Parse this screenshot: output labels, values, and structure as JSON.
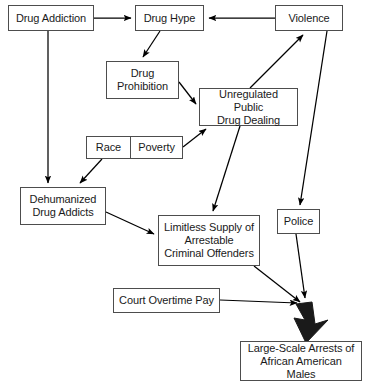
{
  "diagram": {
    "background_color": "#ffffff",
    "box_border_color": "#4d4d4d",
    "text_color": "#1a1a1a",
    "arrow_color": "#000000",
    "nodes": [
      {
        "id": "drug_addiction",
        "label": "Drug Addiction",
        "x": 8,
        "y": 5,
        "w": 86,
        "h": 26
      },
      {
        "id": "drug_hype",
        "label": "Drug Hype",
        "x": 135,
        "y": 5,
        "w": 69,
        "h": 26
      },
      {
        "id": "violence",
        "label": "Violence",
        "x": 275,
        "y": 5,
        "w": 68,
        "h": 26
      },
      {
        "id": "drug_prohibition",
        "label": "Drug\nProhibition",
        "x": 106,
        "y": 61,
        "w": 73,
        "h": 38
      },
      {
        "id": "unregulated_public_drug_dealing",
        "label": "Unregulated Public\nDrug Dealing",
        "x": 199,
        "y": 88,
        "w": 99,
        "h": 38
      },
      {
        "id": "race",
        "label": "Race",
        "x": 86,
        "y": 136,
        "w": 44,
        "h": 23
      },
      {
        "id": "poverty",
        "label": "Poverty",
        "x": 130,
        "y": 136,
        "w": 53,
        "h": 23
      },
      {
        "id": "dehumanized_drug_addicts",
        "label": "Dehumanized\nDrug Addicts",
        "x": 20,
        "y": 187,
        "w": 86,
        "h": 38
      },
      {
        "id": "limitless_supply",
        "label": "Limitless Supply of\nArrestable\nCriminal Offenders",
        "x": 158,
        "y": 215,
        "w": 102,
        "h": 51
      },
      {
        "id": "police",
        "label": "Police",
        "x": 277,
        "y": 209,
        "w": 43,
        "h": 25
      },
      {
        "id": "court_overtime_pay",
        "label": "Court Overtime Pay",
        "x": 113,
        "y": 288,
        "w": 107,
        "h": 25
      },
      {
        "id": "large_scale_arrests",
        "label": "Large-Scale Arrests of\nAfrican American Males",
        "x": 240,
        "y": 341,
        "w": 122,
        "h": 40
      }
    ],
    "edges": [
      {
        "id": "drug-addiction-to-drug-hype",
        "from": "Drug Addiction",
        "to": "Drug Hype",
        "thick": false
      },
      {
        "id": "violence-to-drug-hype",
        "from": "Violence",
        "to": "Drug Hype",
        "thick": false
      },
      {
        "id": "drug-hype-to-drug-prohibition",
        "from": "Drug Hype",
        "to": "Drug Prohibition",
        "thick": false
      },
      {
        "id": "drug-prohibition-to-unregulated-dealing",
        "from": "Drug Prohibition",
        "to": "Unregulated Public Drug Dealing",
        "thick": false
      },
      {
        "id": "unregulated-dealing-to-violence",
        "from": "Unregulated Public Drug Dealing",
        "to": "Violence",
        "thick": false
      },
      {
        "id": "poverty-to-unregulated-dealing",
        "from": "Poverty",
        "to": "Unregulated Public Drug Dealing",
        "thick": false
      },
      {
        "id": "drug-addiction-to-dehumanized-addicts",
        "from": "Drug Addiction",
        "to": "Dehumanized Drug Addicts",
        "thick": false
      },
      {
        "id": "race-to-dehumanized-addicts",
        "from": "Race",
        "to": "Dehumanized Drug Addicts",
        "thick": false
      },
      {
        "id": "dehumanized-addicts-to-limitless-supply",
        "from": "Dehumanized Drug Addicts",
        "to": "Limitless Supply of Arrestable Criminal Offenders",
        "thick": false
      },
      {
        "id": "unregulated-dealing-to-limitless-supply",
        "from": "Unregulated Public Drug Dealing",
        "to": "Limitless Supply of Arrestable Criminal Offenders",
        "thick": false
      },
      {
        "id": "violence-to-police",
        "from": "Violence",
        "to": "Police",
        "thick": false
      },
      {
        "id": "limitless-supply-to-arrests",
        "from": "Limitless Supply of Arrestable Criminal Offenders",
        "to": "Large-Scale Arrests of African American Males",
        "thick": false
      },
      {
        "id": "police-to-arrests",
        "from": "Police",
        "to": "Large-Scale Arrests of African American Males",
        "thick": false
      },
      {
        "id": "court-overtime-pay-to-arrests",
        "from": "Court Overtime Pay",
        "to": "Large-Scale Arrests of African American Males",
        "thick": false
      },
      {
        "id": "convergence-to-arrests-thick",
        "from": "convergence point",
        "to": "Large-Scale Arrests of African American Males",
        "thick": true
      }
    ]
  }
}
